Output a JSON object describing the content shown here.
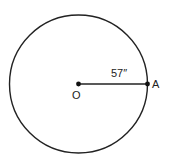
{
  "diagram": {
    "center_label": "O",
    "point_label": "A",
    "radius_label": "57″",
    "colors": {
      "stroke": "#222222",
      "background": "#ffffff"
    }
  }
}
